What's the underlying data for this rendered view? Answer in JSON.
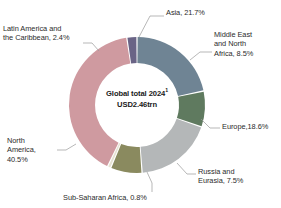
{
  "chart_data": {
    "type": "pie",
    "variant": "donut",
    "title": "",
    "center_label_line1": "Global total 2024",
    "center_label_superscript": "1",
    "center_label_line2": "USD2.46trn",
    "total_value": "USD2.46trn",
    "year": "2024",
    "unit": "%",
    "legend_position": "outside-callouts",
    "start_angle_deg": 0,
    "direction": "clockwise",
    "categories": [
      "Asia",
      "Middle East and North Africa",
      "Europe",
      "Russia and Eurasia",
      "Sub-Saharan Africa",
      "North America",
      "Latin America and the Caribbean"
    ],
    "values": [
      21.7,
      8.5,
      18.6,
      7.5,
      0.8,
      40.5,
      2.4
    ],
    "colors": [
      "#6f8494",
      "#5f7a5f",
      "#b4b7b8",
      "#8a8a5f",
      "#e6e2d2",
      "#cf9aa0",
      "#6a6486"
    ],
    "slices": [
      {
        "name": "Asia",
        "value": 21.7,
        "label": "Asia, 21.7%",
        "color": "#6f8494"
      },
      {
        "name": "Middle East and North Africa",
        "value": 8.5,
        "label": "Middle East and North Africa, 8.5%",
        "color": "#5f7a5f"
      },
      {
        "name": "Europe",
        "value": 18.6,
        "label": "Europe,18.6%",
        "color": "#b4b7b8"
      },
      {
        "name": "Russia and Eurasia",
        "value": 7.5,
        "label": "Russia and Eurasia, 7.5%",
        "color": "#8a8a5f"
      },
      {
        "name": "Sub-Saharan Africa",
        "value": 0.8,
        "label": "Sub-Saharan Africa, 0.8%",
        "color": "#e6e2d2"
      },
      {
        "name": "North America",
        "value": 40.5,
        "label": "North America, 40.5%",
        "color": "#cf9aa0"
      },
      {
        "name": "Latin America and the Caribbean",
        "value": 2.4,
        "label": "Latin America and the Caribbean, 2.4%",
        "color": "#6a6486"
      }
    ]
  },
  "labels": {
    "asia": "Asia, 21.7%",
    "mena": "Middle East\nand North\nAfrica, 8.5%",
    "europe": "Europe,18.6%",
    "russia": "Russia and\nEurasia, 7.5%",
    "subsaharan": "Sub-Saharan Africa, 0.8%",
    "north_america": "North\nAmerica,\n40.5%",
    "latin_america": "Latin America and\nthe Caribbean, 2.4%"
  },
  "center": {
    "line1": "Global total 2024",
    "superscript": "1",
    "line2": "USD2.46trn"
  },
  "style": {
    "leader_line_color": "#9a9a9a",
    "background": "#ffffff",
    "text_color": "#2b2b2b"
  }
}
